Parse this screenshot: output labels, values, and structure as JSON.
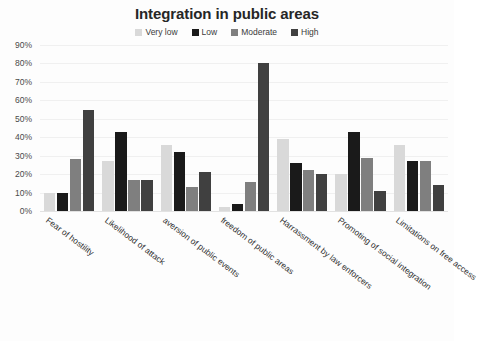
{
  "chart_data": {
    "type": "bar",
    "title": "Integration in public areas",
    "xlabel": "",
    "ylabel": "",
    "ylim": [
      0,
      90
    ],
    "ytick_labels": [
      "90%",
      "80%",
      "70%",
      "60%",
      "50%",
      "40%",
      "30%",
      "20%",
      "10%",
      "0%"
    ],
    "ytick_values": [
      90,
      80,
      70,
      60,
      50,
      40,
      30,
      20,
      10,
      0
    ],
    "grid": true,
    "legend_position": "top",
    "categories": [
      "Fear of hostility",
      "Likelihood of attack",
      "aversion of public events",
      "freedom of public areas",
      "Harrassment by law enforcers",
      "Promoting of social integration",
      "Limitations on free access"
    ],
    "series": [
      {
        "name": "Very low",
        "color": "#d9d9d9",
        "values": [
          10,
          27,
          36,
          2,
          39,
          20,
          36
        ]
      },
      {
        "name": "Low",
        "color": "#1a1a1a",
        "values": [
          10,
          43,
          32,
          4,
          26,
          43,
          27
        ]
      },
      {
        "name": "Moderate",
        "color": "#7f7f7f",
        "values": [
          28,
          17,
          13,
          16,
          22,
          29,
          27
        ]
      },
      {
        "name": "High",
        "color": "#404040",
        "values": [
          55,
          17,
          21,
          80,
          20,
          11,
          14
        ]
      }
    ]
  },
  "colors": {
    "background": "#fdfdfd",
    "title": "#262626",
    "gridline": "#f0f0f0",
    "axis_text": "#4a4a4a"
  }
}
